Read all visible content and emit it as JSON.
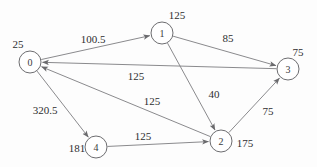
{
  "figure": {
    "name": "directed-weighted-graph",
    "width": 317,
    "height": 167,
    "background_color": "#fdfdfd",
    "node_stroke_color": "#6d6d70",
    "node_fill_color": "#ffffff",
    "edge_color": "#7d7d80",
    "text_color": "#2e2e30"
  },
  "chart_data": {
    "type": "diagram",
    "title": "",
    "nodes": [
      {
        "id": "0",
        "label": "0",
        "weight_label": "25",
        "cx": 30,
        "cy": 62,
        "r": 11,
        "label_x": 18,
        "label_y": 44
      },
      {
        "id": "1",
        "label": "1",
        "weight_label": "125",
        "cx": 162,
        "cy": 33,
        "r": 11,
        "label_x": 177,
        "label_y": 15
      },
      {
        "id": "2",
        "label": "2",
        "weight_label": "175",
        "cx": 221,
        "cy": 141,
        "r": 11,
        "label_x": 245,
        "label_y": 143
      },
      {
        "id": "3",
        "label": "3",
        "weight_label": "75",
        "cx": 288,
        "cy": 69,
        "r": 11,
        "label_x": 298,
        "label_y": 52
      },
      {
        "id": "4",
        "label": "4",
        "weight_label": "181",
        "cx": 96,
        "cy": 147,
        "r": 11,
        "label_x": 77,
        "label_y": 148
      }
    ],
    "edges": [
      {
        "from": "0",
        "to": "1",
        "weight_label": "100.5",
        "label_x": 93,
        "label_y": 39
      },
      {
        "from": "1",
        "to": "3",
        "weight_label": "85",
        "label_x": 228,
        "label_y": 38
      },
      {
        "from": "3",
        "to": "0",
        "weight_label": "125",
        "label_x": 136,
        "label_y": 76
      },
      {
        "from": "1",
        "to": "2",
        "weight_label": "40",
        "label_x": 214,
        "label_y": 94
      },
      {
        "from": "2",
        "to": "0",
        "weight_label": "125",
        "label_x": 152,
        "label_y": 101
      },
      {
        "from": "2",
        "to": "3",
        "weight_label": "75",
        "label_x": 268,
        "label_y": 111
      },
      {
        "from": "0",
        "to": "4",
        "weight_label": "320.5",
        "label_x": 45,
        "label_y": 110
      },
      {
        "from": "4",
        "to": "2",
        "weight_label": "125",
        "label_x": 143,
        "label_y": 136
      }
    ]
  }
}
